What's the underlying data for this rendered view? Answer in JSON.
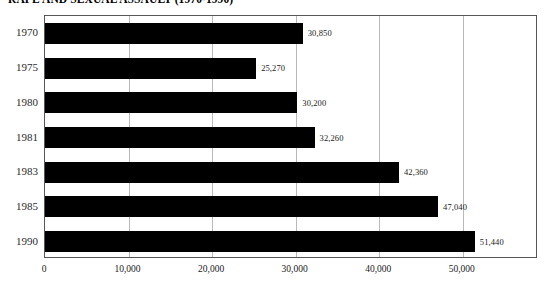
{
  "chart_data": {
    "type": "bar",
    "orientation": "horizontal",
    "title": "RAPE AND SEXUAL ASSAULT (1970-1990)",
    "xlabel": "",
    "ylabel": "",
    "categories": [
      "1970",
      "1975",
      "1980",
      "1981",
      "1983",
      "1985",
      "1990"
    ],
    "values": [
      30850,
      25270,
      30200,
      32260,
      42360,
      47040,
      51440
    ],
    "value_labels": [
      "30,850",
      "25,270",
      "30,200",
      "32,260",
      "42,360",
      "47,040",
      "51,440"
    ],
    "xticks": [
      0,
      10000,
      20000,
      30000,
      40000,
      50000
    ],
    "xtick_labels": [
      "0",
      "10,000",
      "20,000",
      "30,000",
      "40,000",
      "50,000"
    ],
    "xlim": [
      0,
      59000
    ],
    "grid": true,
    "grid_axis": "x",
    "legend": null,
    "bar_color": "#000000",
    "grid_color": "#b9b9bd",
    "frame_color": "#55555a"
  }
}
